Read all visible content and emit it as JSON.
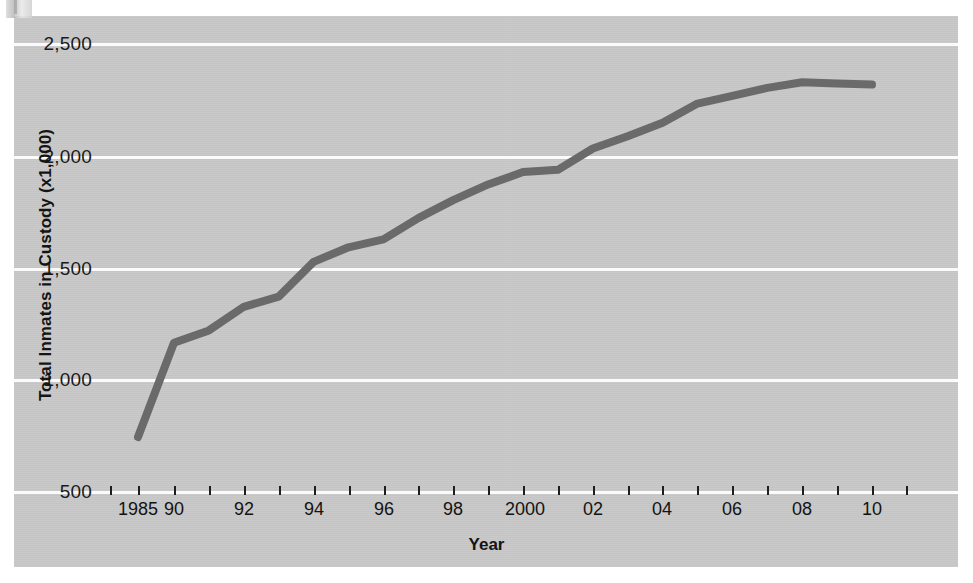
{
  "figure": {
    "background": "#ffffff",
    "panel_color": "#c8c8c8",
    "gridline_color": "#fbfbfb",
    "line_color": "#6a6a6a"
  },
  "axes": {
    "ylabel": "Total Inmates in Custody (x1,000)",
    "xlabel": "Year",
    "yticks": [
      "2,500",
      "2,000",
      "1,500",
      "1,000",
      "500"
    ],
    "ylim": [
      500,
      2500
    ],
    "xticks": [
      "1985",
      "90",
      "",
      "92",
      "",
      "94",
      "",
      "96",
      "",
      "98",
      "",
      "2000",
      "",
      "02",
      "",
      "04",
      "",
      "06",
      "",
      "08",
      "",
      "10",
      ""
    ]
  },
  "chart_data": {
    "type": "line",
    "title": "",
    "xlabel": "Year",
    "ylabel": "Total Inmates in Custody (x1,000)",
    "ylim": [
      500,
      2500
    ],
    "grid": true,
    "legend": "none",
    "x": [
      1985,
      1990,
      1991,
      1992,
      1993,
      1994,
      1995,
      1996,
      1997,
      1998,
      1999,
      2000,
      2001,
      2002,
      2003,
      2004,
      2005,
      2006,
      2007,
      2008,
      2009,
      2010
    ],
    "series": [
      {
        "name": "Total inmates in custody (thousands)",
        "values": [
          745,
          1165,
          1220,
          1325,
          1370,
          1525,
          1590,
          1625,
          1720,
          1800,
          1870,
          1925,
          1935,
          2030,
          2085,
          2145,
          2230,
          2265,
          2300,
          2325,
          2320,
          2315
        ]
      }
    ],
    "xtick_labels": [
      "1985",
      "90",
      "92",
      "94",
      "96",
      "98",
      "2000",
      "02",
      "04",
      "06",
      "08",
      "10"
    ],
    "ytick_labels": [
      "500",
      "1,000",
      "1,500",
      "2,000",
      "2,500"
    ]
  }
}
